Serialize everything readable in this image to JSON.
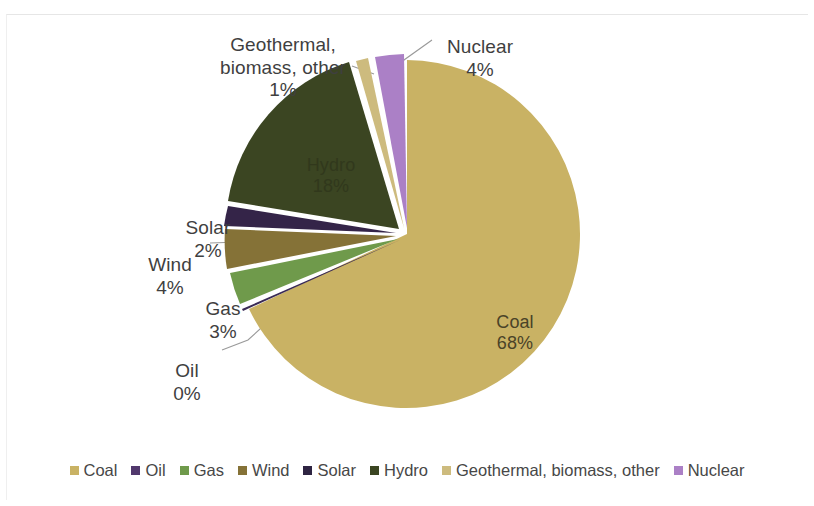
{
  "chart_data": {
    "type": "pie",
    "title": "",
    "categories": [
      "Coal",
      "Oil",
      "Gas",
      "Wind",
      "Solar",
      "Hydro",
      "Geothermal, biomass, other",
      "Nuclear"
    ],
    "values": [
      68,
      0,
      3,
      4,
      2,
      18,
      1,
      4
    ],
    "value_labels": [
      "68%",
      "0%",
      "3%",
      "4%",
      "2%",
      "18%",
      "1%",
      "4%"
    ],
    "unit": "%",
    "legend_position": "bottom",
    "grid": false,
    "slice_colors": [
      "#c9b264",
      "#3a2a55",
      "#6f9a4b",
      "#857237",
      "#342448",
      "#3b4522",
      "#cdbb7e",
      "#ab80c6"
    ]
  },
  "labels": {
    "geothermal": {
      "name": "Geothermal,\nbiomass, other",
      "pct": "1%"
    },
    "nuclear": {
      "name": "Nuclear",
      "pct": "4%"
    },
    "solar": {
      "name": "Solar",
      "pct": "2%"
    },
    "wind": {
      "name": "Wind",
      "pct": "4%"
    },
    "gas": {
      "name": "Gas",
      "pct": "3%"
    },
    "oil": {
      "name": "Oil",
      "pct": "0%"
    },
    "coal": {
      "name": "Coal",
      "pct": "68%"
    },
    "hydro": {
      "name": "Hydro",
      "pct": "18%"
    }
  },
  "legend": {
    "items": [
      {
        "label": "Coal",
        "color": "#c9b264"
      },
      {
        "label": "Oil",
        "color": "#51386d"
      },
      {
        "label": "Gas",
        "color": "#6f9a4b"
      },
      {
        "label": "Wind",
        "color": "#857237"
      },
      {
        "label": "Solar",
        "color": "#2e2442"
      },
      {
        "label": "Hydro",
        "color": "#3b4522"
      },
      {
        "label": "Geothermal, biomass, other",
        "color": "#cdbb7e"
      },
      {
        "label": "Nuclear",
        "color": "#ab80c6"
      }
    ]
  }
}
